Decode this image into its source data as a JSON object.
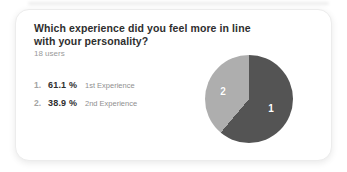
{
  "chart_data": {
    "type": "pie",
    "title": "Which experience did you feel more in line with your personality?",
    "total_label": "18 users",
    "total_users": 18,
    "legend_position": "left",
    "start_angle_deg": 0,
    "direction": "clockwise",
    "slices": [
      {
        "rank": "1.",
        "percent": "61.1 %",
        "value": 61.1,
        "label": "1st Experience",
        "slice_label": "1",
        "color": "#545454"
      },
      {
        "rank": "2.",
        "percent": "38.9 %",
        "value": 38.9,
        "label": "2nd Experience",
        "slice_label": "2",
        "color": "#aeaeae"
      }
    ]
  },
  "colors": {
    "card_background": "#ffffff",
    "card_border": "#ececec",
    "title_text": "#2e2e2e",
    "muted_text": "#9a9a9a",
    "slice1": "#545454",
    "slice2": "#aeaeae"
  }
}
